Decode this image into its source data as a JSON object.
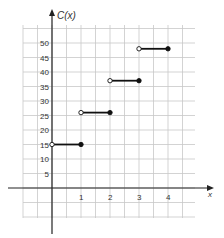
{
  "chart_data": {
    "type": "line",
    "subtype": "step",
    "title": "",
    "xlabel": "x",
    "ylabel": "C(x)",
    "xlim": [
      -1,
      5
    ],
    "ylim": [
      -15,
      55
    ],
    "x_ticks": [
      1,
      2,
      3,
      4
    ],
    "x_tick_labels": [
      "1",
      "2",
      "3",
      "4"
    ],
    "y_ticks": [
      5,
      10,
      15,
      20,
      25,
      30,
      35,
      40,
      45,
      50
    ],
    "y_tick_labels": [
      "5",
      "10",
      "15",
      "20",
      "25",
      "30",
      "35",
      "40",
      "45",
      "50"
    ],
    "grid": true,
    "legend": null,
    "series": [
      {
        "name": "C(x)",
        "segments": [
          {
            "x_start": 0,
            "x_end": 1,
            "y": 15,
            "start_open": true,
            "end_closed": true
          },
          {
            "x_start": 1,
            "x_end": 2,
            "y": 26,
            "start_open": true,
            "end_closed": true
          },
          {
            "x_start": 2,
            "x_end": 3,
            "y": 37,
            "start_open": true,
            "end_closed": true
          },
          {
            "x_start": 3,
            "x_end": 4,
            "y": 48,
            "start_open": true,
            "end_closed": true
          }
        ]
      }
    ]
  },
  "colors": {
    "grid": "#c8c8c8",
    "axis": "#222222",
    "step": "#111111"
  }
}
